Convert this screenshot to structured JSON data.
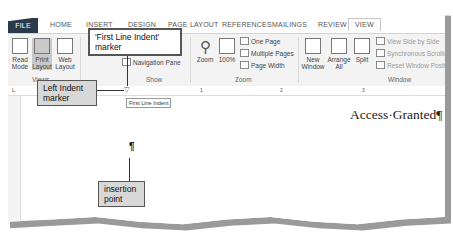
{
  "ribbon": {
    "tabs": [
      "FILE",
      "HOME",
      "INSERT",
      "DESIGN",
      "PAGE LAYOUT",
      "REFERENCES",
      "MAILINGS",
      "REVIEW",
      "VIEW"
    ],
    "active_tab": "VIEW",
    "views": {
      "read_mode": "Read Mode",
      "print_layout": "Print Layout",
      "web_layout": "Web Layout",
      "group": "Views"
    },
    "show": {
      "navigation_pane": "Navigation Pane",
      "group": "Show"
    },
    "zoom": {
      "zoom": "Zoom",
      "hundred": "100%",
      "one_page": "One Page",
      "multiple_pages": "Multiple Pages",
      "page_width": "Page Width",
      "group": "Zoom"
    },
    "window": {
      "new_window": "New Window",
      "arrange_all": "Arrange All",
      "split": "Split",
      "view_side_by_side": "View Side by Side",
      "synchronous_scrolling": "Synchronous Scrolling",
      "reset_window_position": "Reset Window Position",
      "group": "Window"
    }
  },
  "ruler": {
    "numbers": [
      "1",
      "2",
      "3"
    ],
    "tooltip": "First Line Indent"
  },
  "document": {
    "text": "Access·Granted¶",
    "pilcrow": "¶"
  },
  "callouts": {
    "first_line_indent": "'First Line Indent' marker",
    "left_indent": "Left Indent marker",
    "insertion_point": "insertion point"
  }
}
